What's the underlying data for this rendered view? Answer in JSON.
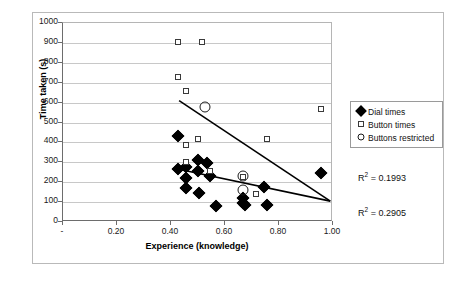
{
  "chart_data": {
    "type": "scatter",
    "title": "",
    "xlabel": "Experience (knowledge)",
    "ylabel": "Time taken (s)",
    "xlim": [
      0,
      1.0
    ],
    "ylim": [
      0,
      1000
    ],
    "grid": true,
    "legend_position": "right",
    "x_tick_labels": [
      "-",
      "0.20",
      "0.40",
      "0.60",
      "0.80",
      "1.00"
    ],
    "x_tick_values": [
      0,
      0.2,
      0.4,
      0.6,
      0.8,
      1.0
    ],
    "y_tick_labels": [
      "0",
      "100",
      "200",
      "300",
      "400",
      "500",
      "600",
      "700",
      "800",
      "900",
      "1000"
    ],
    "y_tick_values": [
      0,
      100,
      200,
      300,
      400,
      500,
      600,
      700,
      800,
      900,
      1000
    ],
    "series": [
      {
        "name": "Dial times",
        "marker": "filled-diamond",
        "points": [
          [
            0.425,
            430
          ],
          [
            0.425,
            265
          ],
          [
            0.455,
            275
          ],
          [
            0.455,
            220
          ],
          [
            0.455,
            172
          ],
          [
            0.5,
            310
          ],
          [
            0.5,
            255
          ],
          [
            0.505,
            145
          ],
          [
            0.535,
            295
          ],
          [
            0.545,
            232
          ],
          [
            0.565,
            80
          ],
          [
            0.665,
            120
          ],
          [
            0.665,
            95
          ],
          [
            0.675,
            85
          ],
          [
            0.745,
            175
          ],
          [
            0.755,
            85
          ],
          [
            0.955,
            245
          ]
        ]
      },
      {
        "name": "Button times",
        "marker": "open-square",
        "points": [
          [
            0.425,
            905
          ],
          [
            0.425,
            730
          ],
          [
            0.455,
            660
          ],
          [
            0.455,
            385
          ],
          [
            0.455,
            300
          ],
          [
            0.5,
            415
          ],
          [
            0.515,
            905
          ],
          [
            0.545,
            255
          ],
          [
            0.665,
            225
          ],
          [
            0.715,
            140
          ],
          [
            0.755,
            415
          ],
          [
            0.955,
            570
          ]
        ]
      },
      {
        "name": "Buttons restricted",
        "marker": "open-circle",
        "points": [
          [
            0.525,
            580
          ],
          [
            0.665,
            230
          ],
          [
            0.665,
            160
          ]
        ]
      }
    ],
    "trendlines": [
      {
        "name": "Button times trend",
        "r_squared_label": "0.1993",
        "x_start": 0.43,
        "y_start": 610,
        "x_end": 0.99,
        "y_end": 105
      },
      {
        "name": "Dial times trend",
        "r_squared_label": "0.2905",
        "x_start": 0.42,
        "y_start": 268,
        "x_end": 0.99,
        "y_end": 105
      }
    ],
    "annotations": [
      {
        "name": "r2-upper",
        "prefix": "R",
        "exponent": "2",
        "text": "= 0.1993"
      },
      {
        "name": "r2-lower",
        "prefix": "R",
        "exponent": "2",
        "text": "= 0.2905"
      }
    ]
  },
  "legend": {
    "items": [
      {
        "label": "Dial times",
        "marker": "filled-diamond"
      },
      {
        "label": "Button times",
        "marker": "open-square"
      },
      {
        "label": "Buttons restricted",
        "marker": "open-circle"
      }
    ]
  },
  "colors": {
    "marker_fill": "#000000",
    "marker_outline": "#3a3a3a",
    "gridline": "#c8c8c8",
    "axis": "#6d6d6d",
    "frame": "#b9b9b9",
    "text": "#111111",
    "background": "#ffffff"
  }
}
